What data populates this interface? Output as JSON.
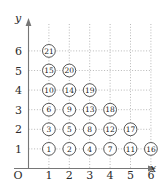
{
  "figure": {
    "kind": "lattice-enumeration-plot",
    "axes": {
      "x_label": "x",
      "y_label": "y",
      "origin_label": "O",
      "x_ticks": [
        "1",
        "2",
        "3",
        "4",
        "5",
        "6"
      ],
      "y_ticks": [
        "1",
        "2",
        "3",
        "4",
        "5",
        "6"
      ],
      "x_tick_values": [
        1,
        2,
        3,
        4,
        5,
        6
      ],
      "y_tick_values": [
        1,
        2,
        3,
        4,
        5,
        6
      ]
    },
    "style": {
      "grid_color": "#9a9a9a",
      "axis_color": "#767676",
      "node_stroke": "#444444",
      "node_fill": "#ffffff",
      "text_color": "#1a1a1a",
      "background": "#ffffff"
    }
  },
  "chart_data": {
    "type": "scatter",
    "title": "",
    "xlabel": "x",
    "ylabel": "y",
    "xlim": [
      0,
      7
    ],
    "ylim": [
      0,
      7
    ],
    "grid": true,
    "legend": "none",
    "point_label_key": "label",
    "points": [
      {
        "x": 1,
        "y": 1,
        "label": "1"
      },
      {
        "x": 2,
        "y": 1,
        "label": "2"
      },
      {
        "x": 1,
        "y": 2,
        "label": "3"
      },
      {
        "x": 3,
        "y": 1,
        "label": "4"
      },
      {
        "x": 2,
        "y": 2,
        "label": "5"
      },
      {
        "x": 1,
        "y": 3,
        "label": "6"
      },
      {
        "x": 4,
        "y": 1,
        "label": "7"
      },
      {
        "x": 3,
        "y": 2,
        "label": "8"
      },
      {
        "x": 2,
        "y": 3,
        "label": "9"
      },
      {
        "x": 1,
        "y": 4,
        "label": "10"
      },
      {
        "x": 5,
        "y": 1,
        "label": "11"
      },
      {
        "x": 4,
        "y": 2,
        "label": "12"
      },
      {
        "x": 3,
        "y": 3,
        "label": "13"
      },
      {
        "x": 2,
        "y": 4,
        "label": "14"
      },
      {
        "x": 1,
        "y": 5,
        "label": "15"
      },
      {
        "x": 6,
        "y": 1,
        "label": "16"
      },
      {
        "x": 5,
        "y": 2,
        "label": "17"
      },
      {
        "x": 4,
        "y": 3,
        "label": "18"
      },
      {
        "x": 3,
        "y": 4,
        "label": "19"
      },
      {
        "x": 2,
        "y": 5,
        "label": "20"
      },
      {
        "x": 1,
        "y": 6,
        "label": "21"
      }
    ]
  }
}
